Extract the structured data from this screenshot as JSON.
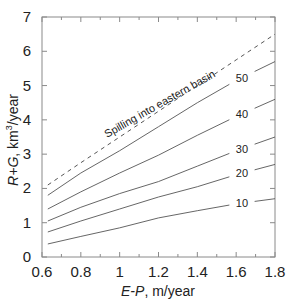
{
  "chart_data": {
    "type": "line",
    "title": "",
    "xlabel": "E-P, m/year",
    "ylabel": "R+G, km3/year",
    "xlim": [
      0.6,
      1.8
    ],
    "ylim": [
      0,
      7
    ],
    "x_ticks": [
      0.6,
      0.8,
      1,
      1.2,
      1.4,
      1.6,
      1.8
    ],
    "x_tick_labels": [
      "0.6",
      "0.8",
      "1",
      "1.2",
      "1.4",
      "1.6",
      "1.8"
    ],
    "y_ticks": [
      0,
      1,
      2,
      3,
      4,
      5,
      6,
      7
    ],
    "y_tick_labels": [
      "0",
      "1",
      "2",
      "3",
      "4",
      "5",
      "6",
      "7"
    ],
    "grid": false,
    "legend": "inline labels",
    "x": [
      0.63,
      0.8,
      1.0,
      1.2,
      1.4,
      1.6,
      1.8
    ],
    "series": [
      {
        "name": "Spilling into eastern basin",
        "style": "dashed",
        "values": [
          2.1,
          2.75,
          3.5,
          4.25,
          5.0,
          5.75,
          6.5
        ]
      },
      {
        "name": "50",
        "style": "solid",
        "values": [
          1.8,
          2.45,
          3.1,
          3.8,
          4.5,
          5.15,
          5.7
        ]
      },
      {
        "name": "40",
        "style": "solid",
        "values": [
          1.4,
          1.9,
          2.45,
          2.97,
          3.55,
          4.1,
          4.6
        ]
      },
      {
        "name": "30",
        "style": "solid",
        "values": [
          1.05,
          1.45,
          1.85,
          2.2,
          2.65,
          3.1,
          3.5
        ]
      },
      {
        "name": "20",
        "style": "solid",
        "values": [
          0.73,
          1.05,
          1.4,
          1.75,
          2.05,
          2.4,
          2.7
        ]
      },
      {
        "name": "10",
        "style": "solid",
        "values": [
          0.38,
          0.6,
          0.85,
          1.14,
          1.35,
          1.55,
          1.7
        ]
      }
    ],
    "annotations": [
      {
        "text": "Spilling into eastern basin",
        "near_series": "dashed"
      },
      {
        "text": "50"
      },
      {
        "text": "40"
      },
      {
        "text": "30"
      },
      {
        "text": "20"
      },
      {
        "text": "10"
      }
    ]
  },
  "labels": {
    "xlabel_italic": "E-P",
    "xlabel_rest": ", m/year",
    "ylabel_italic": "R+G",
    "ylabel_rest": ", km",
    "ylabel_sup": "3",
    "ylabel_tail": "/year",
    "annotation": "Spilling into eastern basin"
  },
  "colors": {
    "axis": "#8a8a8a",
    "line": "#555555",
    "text": "#222222"
  }
}
